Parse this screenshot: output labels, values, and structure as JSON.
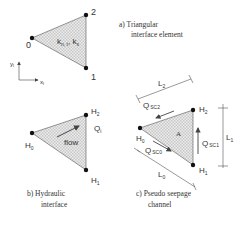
{
  "colors": {
    "line": "#444444",
    "fill": "#d9d9d9",
    "node": "#111111",
    "text": "#333333"
  },
  "panel_a": {
    "caption_line1": "a)  Triangular",
    "caption_line2": "interface element",
    "nodes": [
      "0",
      "1",
      "2"
    ],
    "permeability_label": "k",
    "perm_sub_1": "n, t",
    "perm_sub_2": "s",
    "axis_y": "y",
    "axis_y_sub": "l",
    "axis_x": "x",
    "axis_x_sub": "l"
  },
  "panel_b": {
    "caption_line1": "b)  Hydraulic",
    "caption_line2": "interface",
    "nodes": [
      "H",
      "H",
      "H"
    ],
    "node_subs": [
      "0",
      "1",
      "2"
    ],
    "flow_label": "flow",
    "q_label": "Q",
    "q_sub": "i"
  },
  "panel_c": {
    "caption_line1": "c)  Pseudo seepage",
    "caption_line2": "channel",
    "nodes": [
      "H",
      "H",
      "H"
    ],
    "node_subs": [
      "0",
      "1",
      "2"
    ],
    "area_label": "A",
    "flows": [
      {
        "label": "Q",
        "sub": "SC0"
      },
      {
        "label": "Q",
        "sub": "SC1"
      },
      {
        "label": "Q",
        "sub": "SC2"
      }
    ],
    "lengths": [
      {
        "label": "L",
        "sub": "0"
      },
      {
        "label": "L",
        "sub": "1"
      },
      {
        "label": "L",
        "sub": "2"
      }
    ]
  }
}
